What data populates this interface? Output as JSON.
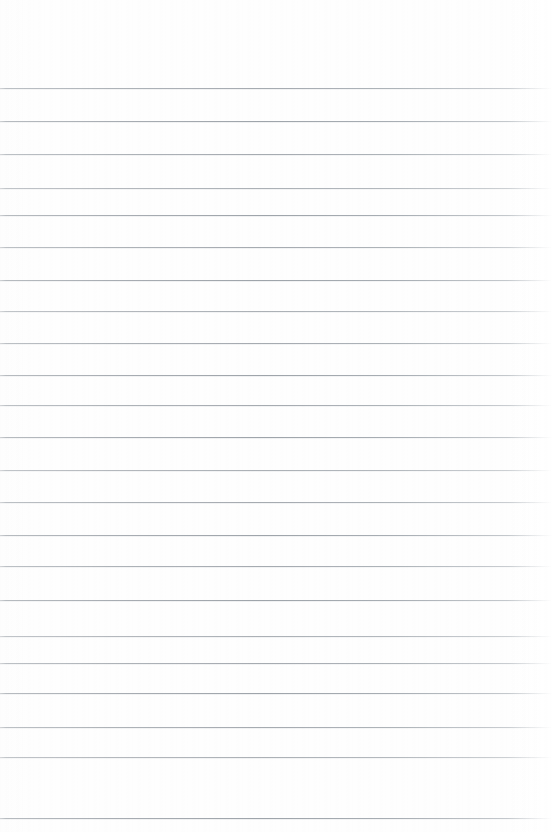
{
  "document": {
    "type": "ruled-paper",
    "title": "Blank Ruled Paper",
    "description": "A blank sheet of lined writing paper with no handwriting, text, or marks.",
    "content_text": "",
    "has_text": false,
    "has_handwriting": false,
    "has_margin_rule": false,
    "orientation": "portrait"
  },
  "page": {
    "width": 552,
    "height": 832,
    "background_color": "#ffffff",
    "paper_tint": "#fefefe"
  },
  "ruling": {
    "style": "horizontal-ruled",
    "line_color": "#a6abb1",
    "line_thickness_px": 1,
    "line_count": 23,
    "first_line_y": 88,
    "last_line_y": 818,
    "line_spacing_px": 33.2,
    "line_start_x": 0,
    "line_end_x": 545,
    "top_margin_px": 88,
    "left_margin_px": 0,
    "right_fade_start_x": 508,
    "line_positions_y": [
      88,
      121,
      154,
      188,
      215,
      247,
      280,
      311,
      343,
      375,
      405,
      437,
      470,
      502,
      535,
      566,
      600,
      636,
      663,
      693,
      727,
      757,
      818
    ],
    "line_tones": [
      "tone-a",
      "tone-b",
      "tone-a",
      "tone-c",
      "tone-b",
      "tone-a",
      "tone-b",
      "tone-c",
      "tone-a",
      "tone-b",
      "tone-a",
      "tone-b",
      "tone-c",
      "tone-a",
      "tone-b",
      "tone-a",
      "tone-b",
      "tone-c",
      "tone-a",
      "tone-b",
      "tone-a",
      "tone-c",
      "tone-b"
    ]
  }
}
